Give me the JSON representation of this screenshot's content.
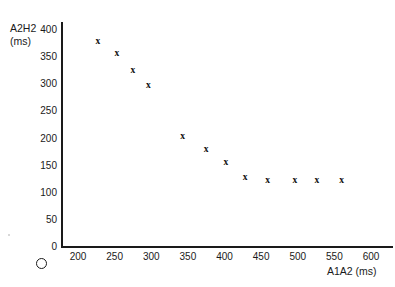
{
  "chart_data": {
    "type": "scatter",
    "title": "",
    "xlabel": "A1A2 (ms)",
    "ylabel": "A2H2 (ms)",
    "ylabel_lines": [
      "A2H2",
      "(ms)"
    ],
    "xlim": [
      150,
      620
    ],
    "ylim": [
      0,
      415
    ],
    "grid": false,
    "legend": null,
    "origin_symbol": "O",
    "xticks": [
      200,
      250,
      300,
      350,
      400,
      450,
      500,
      550,
      600
    ],
    "xtick_labels": [
      "200",
      "250",
      "300",
      "350",
      "400",
      "450",
      "500",
      "550",
      "600"
    ],
    "yticks": [
      0,
      50,
      100,
      150,
      200,
      250,
      300,
      350,
      400
    ],
    "ytick_labels": [
      "0",
      "50",
      "100",
      "150",
      "200",
      "250",
      "300",
      "350",
      "400"
    ],
    "marker": "x",
    "series": [
      {
        "name": "A2H2 vs A1A2",
        "points": [
          {
            "x": 227,
            "y": 380
          },
          {
            "x": 253,
            "y": 358
          },
          {
            "x": 275,
            "y": 326
          },
          {
            "x": 296,
            "y": 299
          },
          {
            "x": 343,
            "y": 205
          },
          {
            "x": 375,
            "y": 181
          },
          {
            "x": 402,
            "y": 157
          },
          {
            "x": 428,
            "y": 129
          },
          {
            "x": 459,
            "y": 124
          },
          {
            "x": 496,
            "y": 124
          },
          {
            "x": 526,
            "y": 124
          },
          {
            "x": 560,
            "y": 124
          }
        ]
      }
    ]
  }
}
